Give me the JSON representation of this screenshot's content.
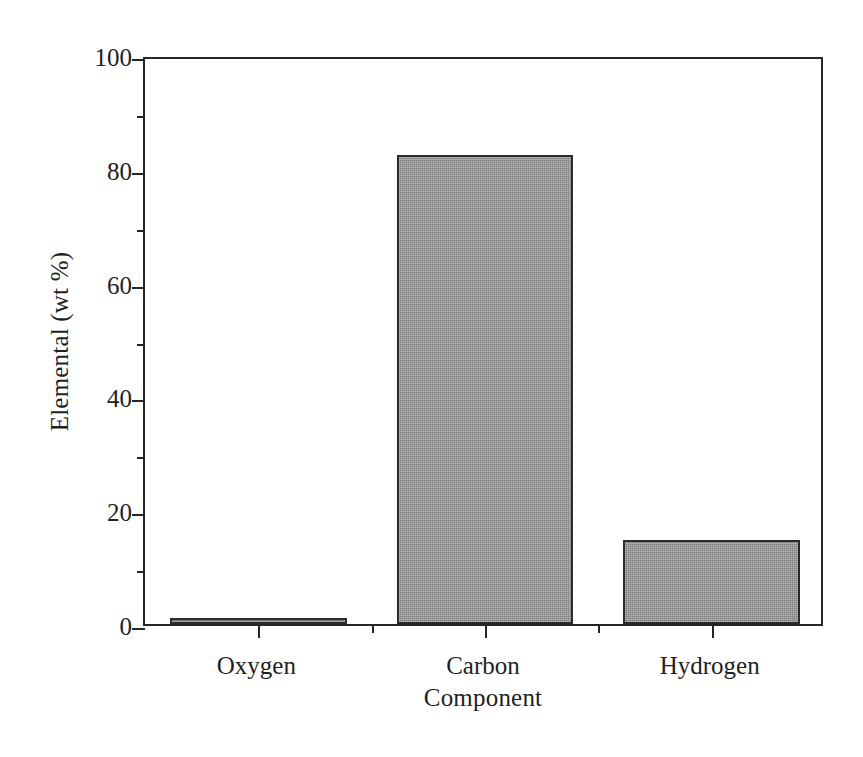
{
  "chart_data": {
    "type": "bar",
    "title": "",
    "subtitle": "",
    "xlabel": "Component",
    "ylabel": "Elemental (wt %)",
    "categories": [
      "Oxygen",
      "Carbon",
      "Hydrogen"
    ],
    "values": [
      1.0,
      82.5,
      14.8
    ],
    "series": [
      {
        "name": "Elemental composition",
        "values": [
          1.0,
          82.5,
          14.8
        ]
      }
    ],
    "ylim": [
      0,
      100
    ],
    "ytick_labels": [
      "0",
      "20",
      "40",
      "60",
      "80",
      "100"
    ],
    "ytick_values": [
      0,
      20,
      40,
      60,
      80,
      100
    ],
    "yminor_values": [
      10,
      30,
      50,
      70,
      90
    ],
    "grid": false,
    "legend": false,
    "legend_position": "none",
    "bar_fill_color": "#9a9a9a",
    "bar_edge_color": "#2b2b2b",
    "axis_color": "#262626",
    "background_color": "#ffffff",
    "annotations": []
  },
  "figure": {
    "name": "elemental-composition-bar-chart"
  }
}
